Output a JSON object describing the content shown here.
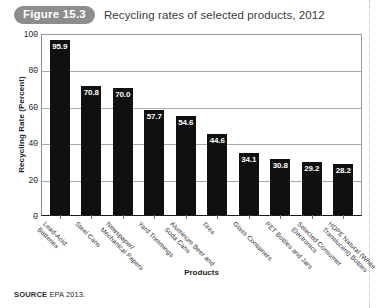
{
  "figure": {
    "badge": "Figure 15.3",
    "title": "Recycling rates of selected products, 2012"
  },
  "source": {
    "label": "SOURCE",
    "text": "EPA 2013."
  },
  "colors": {
    "bar": "#101010",
    "badge_bg": "#8d8d8d",
    "value_label": "#ffffff",
    "gridline": "#a9a9a9",
    "axis": "#1c1c1c"
  },
  "chart_data": {
    "type": "bar",
    "title": "Recycling rates of selected products, 2012",
    "xlabel": "Products",
    "ylabel": "Recycling Rate (Percent)",
    "ylim": [
      0,
      100
    ],
    "yticks": [
      0,
      20,
      40,
      60,
      80,
      100
    ],
    "ytick_labels": [
      "0",
      "20",
      "40",
      "60",
      "80",
      "100"
    ],
    "grid": "horizontal",
    "legend": "none",
    "orientation": "vertical",
    "categories": [
      "Lead-Acid Batteries",
      "Steel Cans",
      "Newspaper/ Mechanical Papers",
      "Yard Trimmings",
      "Aluminum Beer and Soda Cans",
      "Tires",
      "Glass Containers",
      "PET Bottles and Jars",
      "Selected Consumer Electronics",
      "HDPE Natural (White Translucent) Bottles"
    ],
    "category_lines": [
      [
        "Lead-Acid",
        "Batteries"
      ],
      [
        "Steel Cans"
      ],
      [
        "Newspaper/",
        "Mechanical Papers"
      ],
      [
        "Yard Trimmings"
      ],
      [
        "Aluminum Beer and",
        "Soda Cans"
      ],
      [
        "Tires"
      ],
      [
        "Glass Containers"
      ],
      [
        "PET Bottles and Jars"
      ],
      [
        "Selected Consumer",
        "Electronics"
      ],
      [
        "HDPE Natural (White",
        "Translucent) Bottles"
      ]
    ],
    "values": [
      95.9,
      70.8,
      70.0,
      57.7,
      54.6,
      44.6,
      34.1,
      30.8,
      29.2,
      28.2
    ],
    "value_labels": [
      "95.9",
      "70.8",
      "70.0",
      "57.7",
      "54.6",
      "44.6",
      "34.1",
      "30.8",
      "29.2",
      "28.2"
    ]
  }
}
